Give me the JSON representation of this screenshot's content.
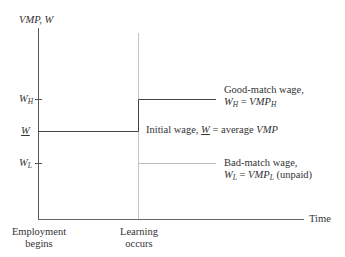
{
  "diagram": {
    "y_axis_label": "VMP, W",
    "x_axis_label": "Time",
    "y_ticks": {
      "high": {
        "base": "W",
        "sub": "H"
      },
      "avg": {
        "base": "W"
      },
      "low": {
        "base": "W",
        "sub": "L"
      }
    },
    "x_events": {
      "start": {
        "line1": "Employment",
        "line2": "begins"
      },
      "learning": {
        "line1": "Learning",
        "line2": "occurs"
      }
    },
    "annotations": {
      "good_match": {
        "line1": "Good-match wage,",
        "eq_lhs_base": "W",
        "eq_lhs_sub": "H",
        "eq_sign": " = ",
        "eq_rhs_base": "VMP",
        "eq_rhs_sub": "H"
      },
      "initial": {
        "prefix": "Initial wage, ",
        "w": "W",
        "suffix_plain": " = average ",
        "suffix_italic": "VMP"
      },
      "bad_match": {
        "line1": "Bad-match wage,",
        "eq_lhs_base": "W",
        "eq_lhs_sub": "L",
        "eq_sign": " = ",
        "eq_rhs_base": "VMP",
        "eq_rhs_sub": "L",
        "note": " (unpaid)"
      }
    },
    "colors": {
      "axis": "#555555",
      "wage_line": "#444444",
      "guide_line": "#bbbbbb",
      "text": "#333333"
    }
  }
}
